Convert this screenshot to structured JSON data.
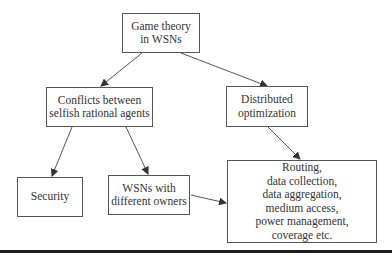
{
  "diagram": {
    "colors": {
      "stroke": "#555555",
      "text": "#333333",
      "rule": "#1a1a1a",
      "background": "#ffffff"
    },
    "nodes": [
      {
        "id": "root",
        "label": "Game theory\nin WSNs",
        "x": 122,
        "y": 13,
        "w": 78,
        "h": 40
      },
      {
        "id": "conflicts",
        "label": "Conflicts between\nselfish rational agents",
        "x": 46,
        "y": 87,
        "w": 107,
        "h": 40
      },
      {
        "id": "distributed",
        "label": "Distributed\noptimization",
        "x": 226,
        "y": 86,
        "w": 82,
        "h": 41
      },
      {
        "id": "security",
        "label": "Security",
        "x": 17,
        "y": 177,
        "w": 66,
        "h": 40
      },
      {
        "id": "owners",
        "label": "WSNs with\ndifferent owners",
        "x": 108,
        "y": 175,
        "w": 82,
        "h": 40
      },
      {
        "id": "applications",
        "label": "Routing,\ndata collection,\ndata aggregation,\nmedium access,\npower management,\ncoverage etc.",
        "x": 227,
        "y": 160,
        "w": 150,
        "h": 83
      }
    ],
    "edges": [
      {
        "from": "root",
        "to": "conflicts",
        "x1": 142,
        "y1": 53,
        "x2": 101,
        "y2": 86
      },
      {
        "from": "root",
        "to": "distributed",
        "x1": 181,
        "y1": 53,
        "x2": 267,
        "y2": 86
      },
      {
        "from": "conflicts",
        "to": "security",
        "x1": 72,
        "y1": 127,
        "x2": 52,
        "y2": 176
      },
      {
        "from": "conflicts",
        "to": "owners",
        "x1": 126,
        "y1": 127,
        "x2": 148,
        "y2": 174
      },
      {
        "from": "distributed",
        "to": "applications",
        "x1": 268,
        "y1": 127,
        "x2": 300,
        "y2": 159
      },
      {
        "from": "owners",
        "to": "applications",
        "x1": 191,
        "y1": 195,
        "x2": 226,
        "y2": 203
      }
    ]
  }
}
